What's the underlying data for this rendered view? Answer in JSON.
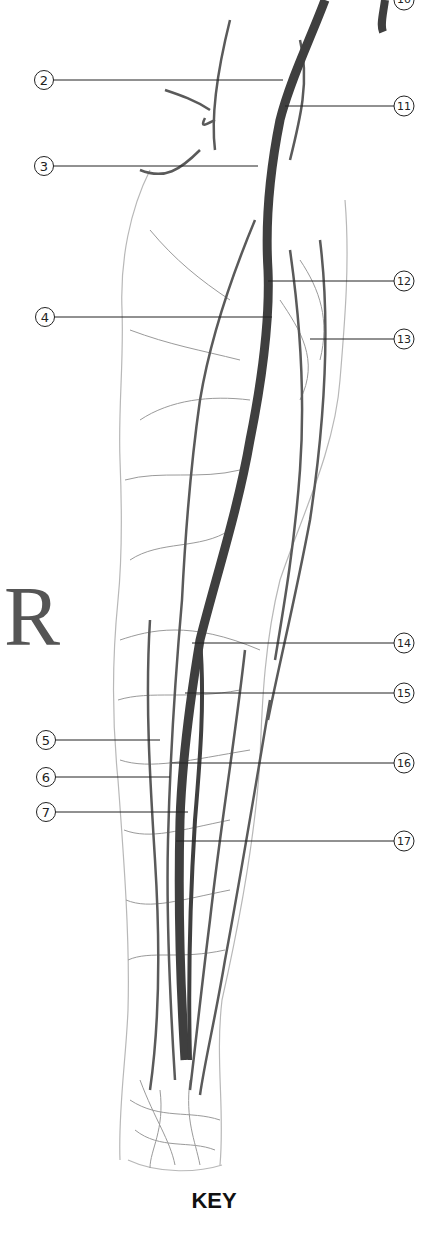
{
  "figure": {
    "side_letter": "R",
    "key_label": "KEY",
    "colors": {
      "main_vessel": "#3f3f3f",
      "secondary_vessel": "#5a5a5a",
      "fine_vessel": "#9a9a9a",
      "outline": "#b8b8b8",
      "callout_line": "#222222"
    },
    "callouts_left": [
      {
        "num": "2",
        "y": 80
      },
      {
        "num": "3",
        "y": 166
      },
      {
        "num": "4",
        "y": 317
      },
      {
        "num": "5",
        "y": 740
      },
      {
        "num": "6",
        "y": 777
      },
      {
        "num": "7",
        "y": 812
      }
    ],
    "callouts_right": [
      {
        "num": "10",
        "y": 0
      },
      {
        "num": "11",
        "y": 106
      },
      {
        "num": "12",
        "y": 281
      },
      {
        "num": "13",
        "y": 339
      },
      {
        "num": "14",
        "y": 643
      },
      {
        "num": "15",
        "y": 693
      },
      {
        "num": "16",
        "y": 763
      },
      {
        "num": "17",
        "y": 841
      }
    ]
  }
}
